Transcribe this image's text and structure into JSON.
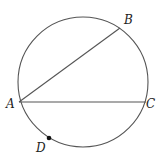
{
  "diagram": {
    "type": "circle-geometry",
    "stroke_color": "#555555",
    "circle": {
      "cx": 83,
      "cy": 82,
      "r": 65
    },
    "points": {
      "A": {
        "label": "A",
        "x": 19,
        "y": 102,
        "label_x": 6,
        "label_y": 108
      },
      "B": {
        "label": "B",
        "x": 120,
        "y": 28,
        "label_x": 124,
        "label_y": 24
      },
      "C": {
        "label": "C",
        "x": 146,
        "y": 102,
        "label_x": 146,
        "label_y": 108
      },
      "D": {
        "label": "D",
        "x": 49,
        "y": 138,
        "label_x": 36,
        "label_y": 152
      }
    },
    "segments": [
      {
        "name": "chord-AB",
        "from": "A",
        "to": "B"
      },
      {
        "name": "chord-AC",
        "from": "A",
        "to": "C"
      }
    ]
  }
}
